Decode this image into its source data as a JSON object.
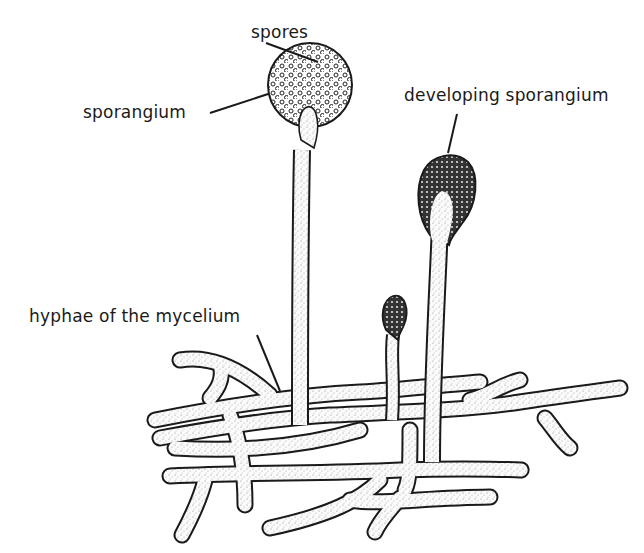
{
  "diagram": {
    "labels": {
      "spores": "spores",
      "sporangium": "sporangium",
      "developing_sporangium": "developing sporangium",
      "hyphae": "hyphae of the mycelium"
    },
    "colors": {
      "ink": "#1a1a1a",
      "fill": "#f4f4f4",
      "background": "#ffffff"
    }
  }
}
